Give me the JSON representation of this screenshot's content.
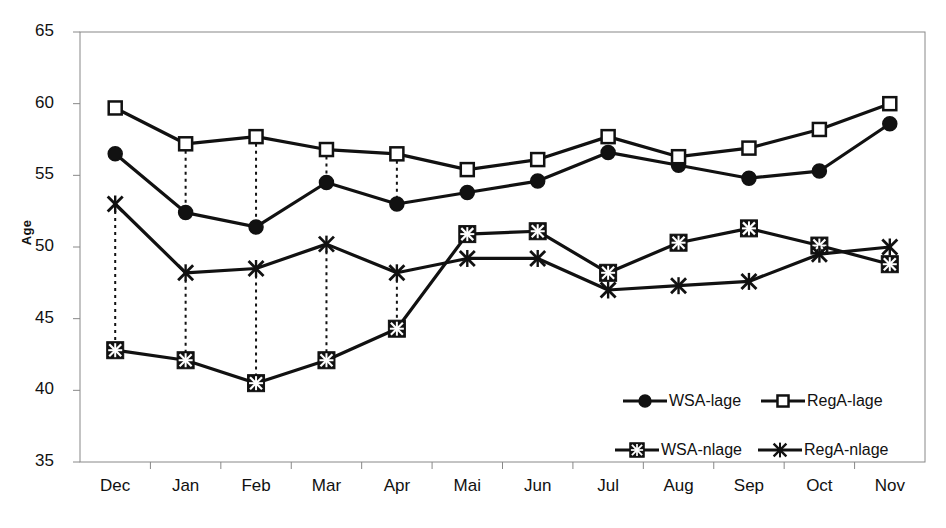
{
  "chart_data": {
    "type": "line",
    "title": "",
    "subtitle": "",
    "xlabel": "",
    "ylabel": "Age",
    "ylim": [
      35,
      65
    ],
    "ytick_values": [
      35,
      40,
      45,
      50,
      55,
      60,
      65
    ],
    "ytick_labels": [
      "35",
      "40",
      "45",
      "50",
      "55",
      "60",
      "65"
    ],
    "grid": false,
    "legend_position": "inside-bottom-right",
    "categories": [
      "Dec",
      "Jan",
      "Feb",
      "Mar",
      "Apr",
      "Mai",
      "Jun",
      "Jul",
      "Aug",
      "Sep",
      "Oct",
      "Nov"
    ],
    "series": [
      {
        "name": "WSA-lage",
        "marker": "filled-circle",
        "values": [
          56.5,
          52.4,
          51.4,
          54.5,
          53.0,
          53.8,
          54.6,
          56.6,
          55.7,
          54.8,
          55.3,
          58.6
        ]
      },
      {
        "name": "RegA-lage",
        "marker": "open-square",
        "values": [
          59.7,
          57.2,
          57.7,
          56.8,
          56.5,
          55.4,
          56.1,
          57.7,
          56.3,
          56.9,
          58.2,
          60.0
        ]
      },
      {
        "name": "WSA-nlage",
        "marker": "filled-square-x",
        "values": [
          42.8,
          42.1,
          40.5,
          42.1,
          44.3,
          50.9,
          51.1,
          48.2,
          50.3,
          51.3,
          50.1,
          48.8
        ]
      },
      {
        "name": "RegA-nlage",
        "marker": "x-cross",
        "values": [
          53.0,
          48.2,
          48.5,
          50.2,
          48.2,
          49.2,
          49.2,
          47.0,
          47.3,
          47.6,
          49.5,
          50.0
        ]
      }
    ],
    "connector_pairs": {
      "description": "vertical dashed connectors between paired series at selected months",
      "months": [
        "Dec",
        "Jan",
        "Feb",
        "Mar",
        "Apr"
      ],
      "pairs": [
        {
          "upper": "RegA-lage",
          "lower": "WSA-lage",
          "months": [
            "Jan",
            "Feb",
            "Mar",
            "Apr"
          ]
        },
        {
          "upper": "RegA-nlage",
          "lower": "WSA-nlage",
          "months": [
            "Dec",
            "Jan",
            "Feb",
            "Mar",
            "Apr"
          ]
        }
      ]
    },
    "colors": {
      "line": "#111111",
      "marker_fill": "#111111",
      "marker_open": "#ffffff",
      "axis": "#888888",
      "background": "#ffffff"
    }
  },
  "legend": {
    "items": [
      {
        "label": "WSA-lage",
        "marker": "filled-circle"
      },
      {
        "label": "RegA-lage",
        "marker": "open-square"
      },
      {
        "label": "WSA-nlage",
        "marker": "filled-square-x"
      },
      {
        "label": "RegA-nlage",
        "marker": "x-cross"
      }
    ]
  },
  "axis": {
    "y_title": "Age"
  }
}
